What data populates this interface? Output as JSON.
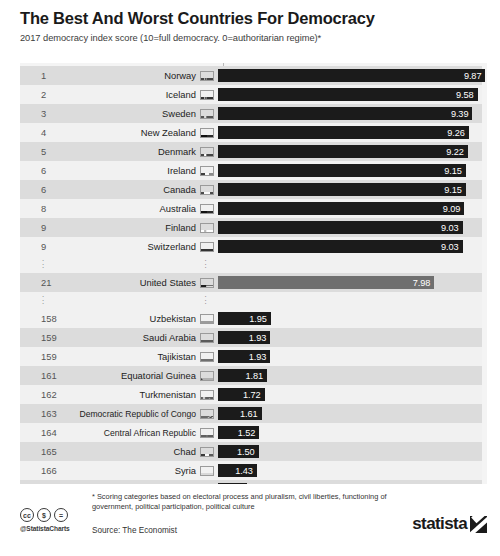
{
  "header": {
    "title": "The Best And Worst Countries For Democracy",
    "subtitle": "2017 democracy index score (10=full democracy. 0=authoritarian regime)*"
  },
  "footer": {
    "note": "* Scoring categories based on electoral process and pluralism, civil liberties, functioning of government, political participation, political culture",
    "source": "Source: The Economist",
    "handle": "@StatistaCharts",
    "cc_badges": [
      "cc",
      "$",
      "="
    ],
    "logo_text": "statista"
  },
  "watermark": {
    "name": "ballot-box-icon"
  },
  "chart_data": {
    "type": "bar",
    "title": "The Best And Worst Countries For Democracy",
    "subtitle": "2017 democracy index score (10=full democracy. 0=authoritarian regime)*",
    "xlabel": "",
    "ylabel": "",
    "xlim": [
      0,
      10
    ],
    "grid": false,
    "legend": "none",
    "orientation": "horizontal",
    "categories": [
      "Norway",
      "Iceland",
      "Sweden",
      "New Zealand",
      "Denmark",
      "Ireland",
      "Canada",
      "Australia",
      "Finland",
      "Switzerland",
      "United States",
      "Uzbekistan",
      "Saudi Arabia",
      "Tajikistan",
      "Equatorial Guinea",
      "Turkmenistan",
      "Democratic Republic of Congo",
      "Central African Republic",
      "Chad",
      "Syria",
      "North Korea"
    ],
    "values": [
      9.87,
      9.58,
      9.39,
      9.26,
      9.22,
      9.15,
      9.15,
      9.09,
      9.03,
      9.03,
      7.98,
      1.95,
      1.93,
      1.93,
      1.81,
      1.72,
      1.61,
      1.52,
      1.5,
      1.43,
      1.08
    ],
    "ranks": [
      "1",
      "2",
      "3",
      "4",
      "5",
      "6",
      "6",
      "8",
      "9",
      "9",
      "21",
      "158",
      "159",
      "159",
      "161",
      "162",
      "163",
      "164",
      "165",
      "166",
      "167"
    ]
  },
  "rows": [
    {
      "rank": "1",
      "country": "Norway",
      "value": "9.87",
      "num": 9.87,
      "flag": "norway-flag",
      "style": "dark",
      "band": "alt"
    },
    {
      "rank": "2",
      "country": "Iceland",
      "value": "9.58",
      "num": 9.58,
      "flag": "iceland-flag",
      "style": "dark",
      "band": "plain"
    },
    {
      "rank": "3",
      "country": "Sweden",
      "value": "9.39",
      "num": 9.39,
      "flag": "sweden-flag",
      "style": "dark",
      "band": "alt"
    },
    {
      "rank": "4",
      "country": "New Zealand",
      "value": "9.26",
      "num": 9.26,
      "flag": "new-zealand-flag",
      "style": "dark",
      "band": "plain"
    },
    {
      "rank": "5",
      "country": "Denmark",
      "value": "9.22",
      "num": 9.22,
      "flag": "denmark-flag",
      "style": "dark",
      "band": "alt"
    },
    {
      "rank": "6",
      "country": "Ireland",
      "value": "9.15",
      "num": 9.15,
      "flag": "ireland-flag",
      "style": "dark",
      "band": "plain"
    },
    {
      "rank": "6",
      "country": "Canada",
      "value": "9.15",
      "num": 9.15,
      "flag": "canada-flag",
      "style": "dark",
      "band": "alt"
    },
    {
      "rank": "8",
      "country": "Australia",
      "value": "9.09",
      "num": 9.09,
      "flag": "australia-flag",
      "style": "dark",
      "band": "plain"
    },
    {
      "rank": "9",
      "country": "Finland",
      "value": "9.03",
      "num": 9.03,
      "flag": "finland-flag",
      "style": "dark",
      "band": "alt"
    },
    {
      "rank": "9",
      "country": "Switzerland",
      "value": "9.03",
      "num": 9.03,
      "flag": "switzerland-flag",
      "style": "dark",
      "band": "plain"
    },
    {
      "ellipsis": true
    },
    {
      "rank": "21",
      "country": "United States",
      "value": "7.98",
      "num": 7.98,
      "flag": "united-states-flag",
      "style": "mid",
      "band": "alt"
    },
    {
      "ellipsis": true
    },
    {
      "rank": "158",
      "country": "Uzbekistan",
      "value": "1.95",
      "num": 1.95,
      "flag": "uzbekistan-flag",
      "style": "dark",
      "band": "plain"
    },
    {
      "rank": "159",
      "country": "Saudi Arabia",
      "value": "1.93",
      "num": 1.93,
      "flag": "saudi-arabia-flag",
      "style": "dark",
      "band": "alt"
    },
    {
      "rank": "159",
      "country": "Tajikistan",
      "value": "1.93",
      "num": 1.93,
      "flag": "tajikistan-flag",
      "style": "dark",
      "band": "plain"
    },
    {
      "rank": "161",
      "country": "Equatorial Guinea",
      "value": "1.81",
      "num": 1.81,
      "flag": "equatorial-guinea-flag",
      "style": "dark",
      "band": "alt"
    },
    {
      "rank": "162",
      "country": "Turkmenistan",
      "value": "1.72",
      "num": 1.72,
      "flag": "turkmenistan-flag",
      "style": "dark",
      "band": "plain"
    },
    {
      "rank": "163",
      "country": "Democratic Republic of Congo",
      "value": "1.61",
      "num": 1.61,
      "flag": "dr-congo-flag",
      "style": "dark",
      "band": "alt"
    },
    {
      "rank": "164",
      "country": "Central African Republic",
      "value": "1.52",
      "num": 1.52,
      "flag": "central-african-republic-flag",
      "style": "dark",
      "band": "plain"
    },
    {
      "rank": "165",
      "country": "Chad",
      "value": "1.50",
      "num": 1.5,
      "flag": "chad-flag",
      "style": "dark",
      "band": "alt"
    },
    {
      "rank": "166",
      "country": "Syria",
      "value": "1.43",
      "num": 1.43,
      "flag": "syria-flag",
      "style": "dark",
      "band": "plain"
    },
    {
      "rank": "167",
      "country": "North Korea",
      "value": "1.08",
      "num": 1.08,
      "flag": "north-korea-flag",
      "style": "dark",
      "band": "alt"
    }
  ]
}
